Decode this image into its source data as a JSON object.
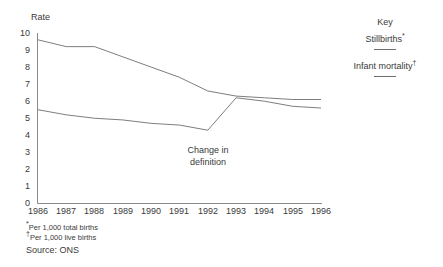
{
  "chart_data": {
    "type": "line",
    "title": "",
    "ylabel": "Rate",
    "xlabel": "",
    "ylim": [
      0,
      10
    ],
    "ytick_labels": [
      "10",
      "9",
      "8",
      "7",
      "6",
      "5",
      "4",
      "3",
      "2",
      "1",
      "0"
    ],
    "grid": false,
    "legend_position": "right",
    "categories": [
      "1986",
      "1987",
      "1988",
      "1989",
      "1990",
      "1991",
      "1992",
      "1993",
      "1994",
      "1995",
      "1996"
    ],
    "series": [
      {
        "name": "Stillbirths*",
        "values": [
          9.6,
          9.2,
          9.2,
          8.6,
          8.0,
          7.4,
          6.6,
          6.3,
          6.2,
          6.1,
          6.1
        ]
      },
      {
        "name": "Infant mortality†",
        "values": [
          5.5,
          5.2,
          5.0,
          4.9,
          4.7,
          4.6,
          4.3,
          6.2,
          6.0,
          5.7,
          5.6
        ]
      }
    ],
    "annotations": [
      {
        "name": "change-in-definition",
        "line1": "Change in",
        "line2": "definition",
        "x_category": "1992"
      }
    ],
    "colors": {
      "line": "#6e6e6e",
      "axis": "#8a8a8a",
      "text": "#3a3a3a"
    }
  },
  "legend": {
    "title": "Key",
    "entries": [
      {
        "label": "Stillbirths",
        "marker": "*"
      },
      {
        "label": "Infant mortality",
        "marker": "†"
      }
    ]
  },
  "footnotes": [
    {
      "marker": "*",
      "text": "Per 1,000 total births"
    },
    {
      "marker": "†",
      "text": "Per 1,000 live births"
    }
  ],
  "source": "Source: ONS"
}
